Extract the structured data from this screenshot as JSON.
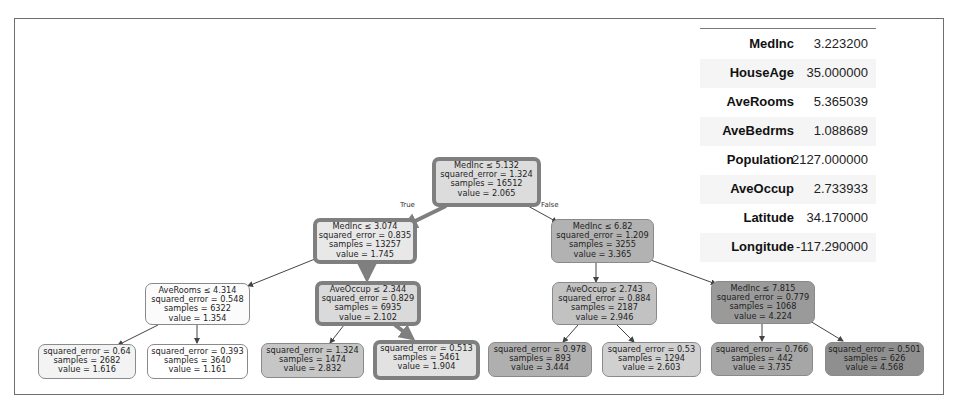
{
  "feature_table": {
    "rows": [
      {
        "name": "MedInc",
        "value": "3.223200"
      },
      {
        "name": "HouseAge",
        "value": "35.000000"
      },
      {
        "name": "AveRooms",
        "value": "5.365039"
      },
      {
        "name": "AveBedrms",
        "value": "1.088689"
      },
      {
        "name": "Population",
        "value": "2127.000000"
      },
      {
        "name": "AveOccup",
        "value": "2.733933"
      },
      {
        "name": "Latitude",
        "value": "34.170000"
      },
      {
        "name": "Longitude",
        "value": "-117.290000"
      }
    ]
  },
  "tree": {
    "edge_labels": {
      "true": "True",
      "false": "False"
    },
    "colors": {
      "path_border": "#7f7f7f",
      "node_border": "#8a8a8a"
    },
    "nodes": {
      "root": {
        "lines": [
          "MedInc ≤ 5.132",
          "squared_error = 1.324",
          "samples = 16512",
          "value = 2.065"
        ],
        "fill": "#dcdcdc"
      },
      "l1_left": {
        "lines": [
          "MedInc ≤ 3.074",
          "squared_error = 0.835",
          "samples = 13257",
          "value = 1.745"
        ],
        "fill": "#e8e8e8"
      },
      "l1_right": {
        "lines": [
          "MedInc ≤ 6.82",
          "squared_error = 1.209",
          "samples = 3255",
          "value = 3.365"
        ],
        "fill": "#b2b2b2"
      },
      "l2_a": {
        "lines": [
          "AveRooms ≤ 4.314",
          "squared_error = 0.548",
          "samples = 6322",
          "value = 1.354"
        ],
        "fill": "#fbfbfb"
      },
      "l2_b": {
        "lines": [
          "AveOccup ≤ 2.344",
          "squared_error = 0.829",
          "samples = 6935",
          "value = 2.102"
        ],
        "fill": "#dadada"
      },
      "l2_c": {
        "lines": [
          "AveOccup ≤ 2.743",
          "squared_error = 0.884",
          "samples = 2187",
          "value = 2.946"
        ],
        "fill": "#c2c2c2"
      },
      "l2_d": {
        "lines": [
          "MedInc ≤ 7.815",
          "squared_error = 0.779",
          "samples = 1068",
          "value = 4.224"
        ],
        "fill": "#9a9a9a"
      },
      "leaf_1": {
        "lines": [
          "squared_error = 0.64",
          "samples = 2682",
          "value = 1.616"
        ],
        "fill": "#f3f3f3"
      },
      "leaf_2": {
        "lines": [
          "squared_error = 0.393",
          "samples = 3640",
          "value = 1.161"
        ],
        "fill": "#ffffff"
      },
      "leaf_3": {
        "lines": [
          "squared_error = 1.324",
          "samples = 1474",
          "value = 2.832"
        ],
        "fill": "#c6c6c6"
      },
      "leaf_4": {
        "lines": [
          "squared_error = 0.513",
          "samples = 5461",
          "value = 1.904"
        ],
        "fill": "#e2e2e2"
      },
      "leaf_5": {
        "lines": [
          "squared_error = 0.978",
          "samples = 893",
          "value = 3.444"
        ],
        "fill": "#afafaf"
      },
      "leaf_6": {
        "lines": [
          "squared_error = 0.53",
          "samples = 1294",
          "value = 2.603"
        ],
        "fill": "#d0d0d0"
      },
      "leaf_7": {
        "lines": [
          "squared_error = 0.766",
          "samples = 442",
          "value = 3.735"
        ],
        "fill": "#a6a6a6"
      },
      "leaf_8": {
        "lines": [
          "squared_error = 0.501",
          "samples = 626",
          "value = 4.568"
        ],
        "fill": "#8f8f8f"
      }
    }
  }
}
